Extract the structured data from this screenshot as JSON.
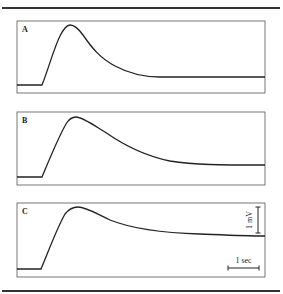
{
  "figure": {
    "panels": [
      {
        "label": "A",
        "description": "potential rises quickly to a peak then decays to a low plateau"
      },
      {
        "label": "B",
        "description": "potential rises to a peak then decays more slowly to a plateau"
      },
      {
        "label": "C",
        "description": "potential rises to a peak then decays slowly, remaining elevated"
      }
    ],
    "scale_bar": {
      "voltage_label": "1 mV",
      "time_label": "1 sec"
    }
  }
}
